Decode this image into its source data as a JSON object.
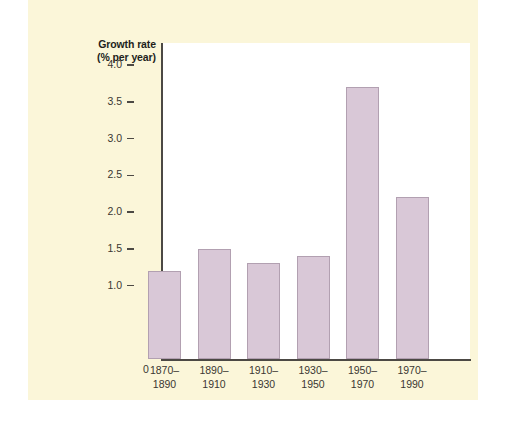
{
  "chart_data": {
    "type": "bar",
    "title": "",
    "ylabel": "Growth rate\n(% per year)",
    "ylabel_line1": "Growth rate",
    "ylabel_line2": "(% per year)",
    "xlabel": "",
    "categories": [
      "1870–\n1890",
      "1890–\n1910",
      "1910–\n1930",
      "1930–\n1950",
      "1950–\n1970",
      "1970–\n1990"
    ],
    "category_lines": [
      {
        "line1": "1870–",
        "line2": "1890"
      },
      {
        "line1": "1890–",
        "line2": "1910"
      },
      {
        "line1": "1910–",
        "line2": "1930"
      },
      {
        "line1": "1930–",
        "line2": "1950"
      },
      {
        "line1": "1950–",
        "line2": "1970"
      },
      {
        "line1": "1970–",
        "line2": "1990"
      }
    ],
    "values": [
      1.2,
      1.5,
      1.3,
      1.4,
      3.7,
      2.2
    ],
    "ylim": [
      0,
      4.3
    ],
    "ytick_labels": [
      "1.0",
      "1.5",
      "2.0",
      "2.5",
      "3.0",
      "3.5",
      "4.0"
    ],
    "ytick_values": [
      1.0,
      1.5,
      2.0,
      2.5,
      3.0,
      3.5,
      4.0
    ],
    "origin_label": "0",
    "grid": false,
    "legend": null,
    "bar_color": "#d9c8d7",
    "bar_edge_color": "#b2a0b1",
    "axis_color": "#4c4944",
    "panel_color": "#fbf6d9",
    "plot_background": "#ffffff",
    "text_color": "#3a3732"
  }
}
